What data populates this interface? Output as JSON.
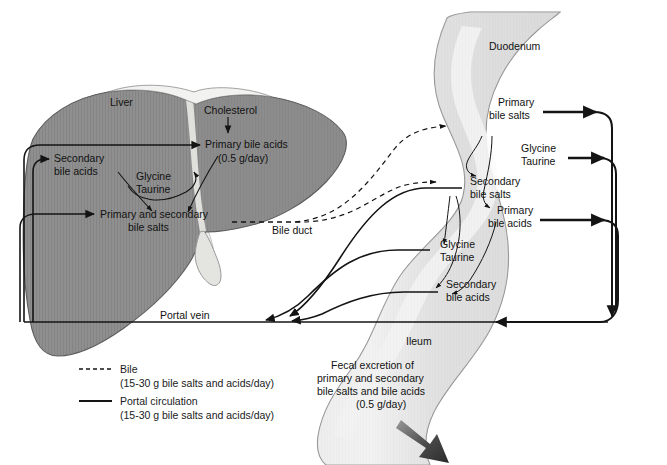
{
  "organs": {
    "liver": "Liver",
    "duodenum": "Duodenum",
    "ileum": "Ileum",
    "bile_duct": "Bile duct",
    "portal_vein": "Portal vein"
  },
  "liver_labels": {
    "cholesterol": "Cholesterol",
    "primary_bile_acids": "Primary bile acids",
    "primary_bile_acids_rate": "(0.5 g/day)",
    "secondary_bile_acids_l1": "Secondary",
    "secondary_bile_acids_l2": "bile acids",
    "glycine": "Glycine",
    "taurine": "Taurine",
    "primary_secondary_salts_l1": "Primary and secondary",
    "primary_secondary_salts_l2": "bile salts"
  },
  "intestine_labels": {
    "primary_bile_salts_l1": "Primary",
    "primary_bile_salts_l2": "bile salts",
    "glycine": "Glycine",
    "taurine": "Taurine",
    "secondary_bile_salts_l1": "Secondary",
    "secondary_bile_salts_l2": "bile salts",
    "primary_bile_acids_l1": "Primary",
    "primary_bile_acids_l2": "bile acids",
    "secondary_bile_acids_l1": "Secondary",
    "secondary_bile_acids_l2": "bile acids"
  },
  "fecal": {
    "line1": "Fecal excretion of",
    "line2": "primary and secondary",
    "line3": "bile salts and bile acids",
    "line4": "(0.5 g/day)"
  },
  "legend": {
    "bile_label": "Bile",
    "bile_rate": "(15-30 g bile salts and acids/day)",
    "portal_label": "Portal circulation",
    "portal_rate": "(15-30 g bile salts and acids/day)"
  },
  "colors": {
    "background": "#ffffff",
    "liver_fill": "#8f8f8f",
    "liver_stroke": "#5d5d5d",
    "intestine_fill": "#dedede",
    "intestine_highlight": "#f6f6f6",
    "intestine_stroke": "#8d8d8d",
    "duct_fill": "#e6e6e4",
    "line": "#141414",
    "text": "#121212"
  }
}
